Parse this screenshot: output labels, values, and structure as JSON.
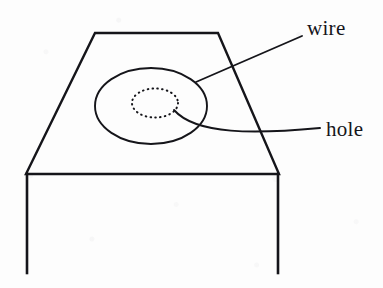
{
  "figure": {
    "kind": "line-drawing",
    "width": 383,
    "height": 288,
    "background_color": "#fdfdfd",
    "ink_color": "#15151a"
  },
  "labels": {
    "wire": "wire",
    "hole": "hole"
  },
  "shapes": {
    "table": {
      "name": "table",
      "description": "trapezoid table top in perspective with two vertical legs",
      "top_edge": {
        "x1": 95,
        "y1": 33,
        "x2": 218,
        "y2": 33
      },
      "left_edge": {
        "x1": 95,
        "y1": 33,
        "x2": 26,
        "y2": 174
      },
      "right_edge": {
        "x1": 218,
        "y1": 33,
        "x2": 279,
        "y2": 174
      },
      "front_edge": {
        "x1": 26,
        "y1": 174,
        "x2": 279,
        "y2": 174
      },
      "left_leg": {
        "x1": 27,
        "y1": 174,
        "x2": 27,
        "y2": 273
      },
      "right_leg": {
        "x1": 278,
        "y1": 174,
        "x2": 278,
        "y2": 273
      },
      "stroke_width": 2.4
    },
    "wire_loop": {
      "name": "wire-loop",
      "description": "solid ellipse representing a closed wire loop resting on the table",
      "cx": 151,
      "cy": 106,
      "rx": 56,
      "ry": 38,
      "stroke_style": "solid",
      "stroke_width": 1.9
    },
    "hole": {
      "name": "hole",
      "description": "small dotted ellipse representing a hole in the table surface",
      "cx": 155,
      "cy": 103,
      "rx": 23,
      "ry": 14.5,
      "stroke_style": "dotted",
      "stroke_width": 2.0,
      "dash_pattern": "0.6 4.2"
    }
  },
  "leaders": {
    "wire_leader": {
      "name": "wire-leader-line",
      "description": "straight leader from the wire loop up-right to the wire label",
      "x1": 196,
      "y1": 82,
      "x2": 302,
      "y2": 36,
      "stroke_width": 1.9
    },
    "hole_leader": {
      "name": "hole-leader-line",
      "description": "curved leader from the hole rightwards to the hole label",
      "start": {
        "x": 174,
        "y": 110
      },
      "control1": {
        "x": 196,
        "y": 135
      },
      "control2": {
        "x": 255,
        "y": 134
      },
      "end": {
        "x": 320,
        "y": 128
      },
      "stroke_width": 1.9
    }
  }
}
